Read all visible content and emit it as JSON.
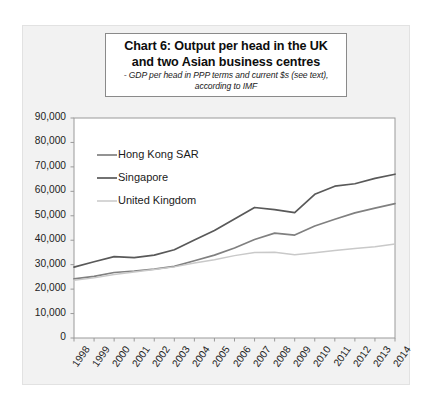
{
  "title": {
    "line1": "Chart 6: Output per head in the UK",
    "line2": "and two Asian business centres",
    "sub1": "- GDP per head in PPP terms and current $s (see text),",
    "sub2": "according to IMF"
  },
  "colors": {
    "singapore": "#595959",
    "hong_kong": "#808080",
    "united_kingdom": "#c9c9c9",
    "plot_background": "#ffffff",
    "chart_background": "#f2f2f2",
    "axis": "#9a9a9a",
    "text": "#222222"
  },
  "chart_data": {
    "type": "line",
    "title": "Chart 6: Output per head in the UK and two Asian business centres",
    "subtitle": "- GDP per head in PPP terms and current $s (see text), according to IMF",
    "xlabel": "",
    "ylabel": "",
    "ylim": [
      0,
      90000
    ],
    "ytick_values": [
      0,
      10000,
      20000,
      30000,
      40000,
      50000,
      60000,
      70000,
      80000,
      90000
    ],
    "ytick_labels": [
      "0",
      "10,000",
      "20,000",
      "30,000",
      "40,000",
      "50,000",
      "60,000",
      "70,000",
      "80,000",
      "90,000"
    ],
    "grid": false,
    "legend_position": "top-left-inside",
    "categories": [
      "1998",
      "1999",
      "2000",
      "2001",
      "2002",
      "2003",
      "2004",
      "2005",
      "2006",
      "2007",
      "2008",
      "2009",
      "2010",
      "2011",
      "2012",
      "2013",
      "2014"
    ],
    "series": [
      {
        "name": "Hong Kong SAR",
        "color": "#808080",
        "values": [
          24200,
          25200,
          26800,
          27400,
          28200,
          29300,
          31600,
          33900,
          36800,
          40300,
          42900,
          42100,
          45800,
          48600,
          51200,
          53100,
          55000
        ]
      },
      {
        "name": "Singapore",
        "color": "#595959",
        "values": [
          29000,
          31200,
          33300,
          32900,
          33900,
          36100,
          40100,
          44000,
          48700,
          53400,
          52500,
          51300,
          58800,
          62100,
          63100,
          65300,
          67000
        ]
      },
      {
        "name": "United Kingdom",
        "color": "#c9c9c9",
        "values": [
          23600,
          24600,
          26000,
          27000,
          28000,
          29100,
          30700,
          32000,
          33700,
          35000,
          35100,
          34100,
          34900,
          35800,
          36600,
          37300,
          38500
        ]
      }
    ]
  }
}
